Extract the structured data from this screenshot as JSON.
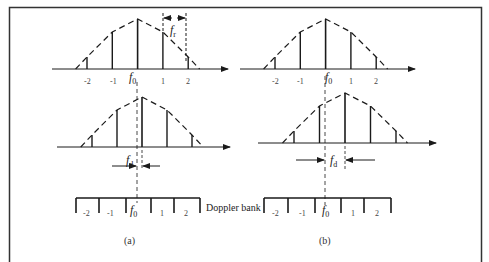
{
  "figure": {
    "panels": [
      {
        "id": "a",
        "caption": "(a)",
        "top_spectrum": {
          "tick_labels": [
            "-2",
            "-1",
            "1",
            "2"
          ],
          "center_label": "f",
          "center_sub": "0",
          "relative_heights": [
            0.24,
            0.74,
            1.0,
            0.74,
            0.24
          ],
          "spacing_label": "f",
          "spacing_sub": "r"
        },
        "shifted_spectrum": {
          "relative_heights": [
            0.24,
            0.74,
            1.0,
            0.74,
            0.24
          ],
          "shift_label": "f",
          "shift_sub": "d",
          "shift_fraction_of_bin": 0.2
        },
        "doppler_bank": {
          "bin_labels": [
            "-2",
            "-1",
            "f",
            "1",
            "2"
          ],
          "center_sub": "0"
        }
      },
      {
        "id": "b",
        "caption": "(b)",
        "top_spectrum": {
          "tick_labels": [
            "-2",
            "-1",
            "1",
            "2"
          ],
          "center_label": "f",
          "center_sub": "0",
          "relative_heights": [
            0.24,
            0.74,
            1.0,
            0.74,
            0.24
          ]
        },
        "shifted_spectrum": {
          "relative_heights": [
            0.24,
            0.74,
            1.0,
            0.74,
            0.24
          ],
          "shift_label": "f",
          "shift_sub": "d",
          "shift_fraction_of_bin": 0.8
        },
        "doppler_bank": {
          "bin_labels": [
            "-2",
            "-1",
            "f",
            "1",
            "2"
          ],
          "center_sub": "0"
        }
      }
    ],
    "bank_label": "Doppler bank",
    "colors": {
      "line": "#1a1a1a",
      "dash": "#1a1a1a",
      "frame": "#333333"
    }
  }
}
